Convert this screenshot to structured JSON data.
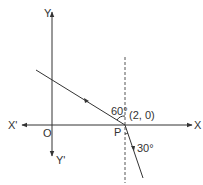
{
  "diagram": {
    "axes": {
      "x_pos_label": "X",
      "x_neg_label": "X'",
      "y_pos_label": "Y",
      "y_neg_label": "Y'",
      "origin_label": "O"
    },
    "point": {
      "label": "P",
      "coords": "(2, 0)"
    },
    "angles": {
      "incident": "60°",
      "refracted": "30°"
    },
    "colors": {
      "line": "#333333",
      "dashed": "#555555"
    }
  }
}
